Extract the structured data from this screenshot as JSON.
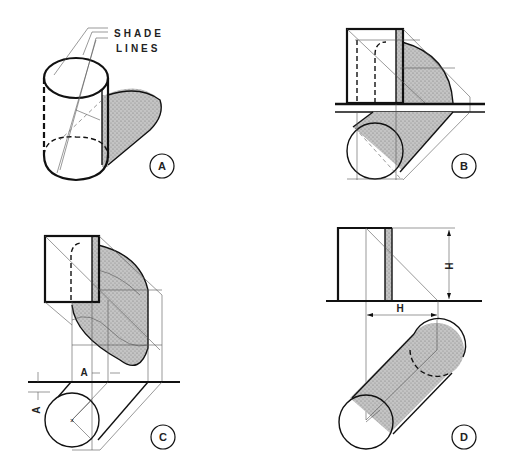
{
  "figure": {
    "panels": [
      {
        "id": "A",
        "label": "A",
        "annotation_line1": "SHADE",
        "annotation_line2": "LINES"
      },
      {
        "id": "B",
        "label": "B"
      },
      {
        "id": "C",
        "label": "C",
        "dimension_horizontal": "A",
        "dimension_vertical": "A"
      },
      {
        "id": "D",
        "label": "D",
        "dimension_vertical": "H",
        "dimension_horizontal": "H"
      }
    ]
  },
  "colors": {
    "ink": "#111111",
    "construction": "#555555",
    "shadow_fill": "#b8b8b8",
    "background": "#ffffff"
  }
}
